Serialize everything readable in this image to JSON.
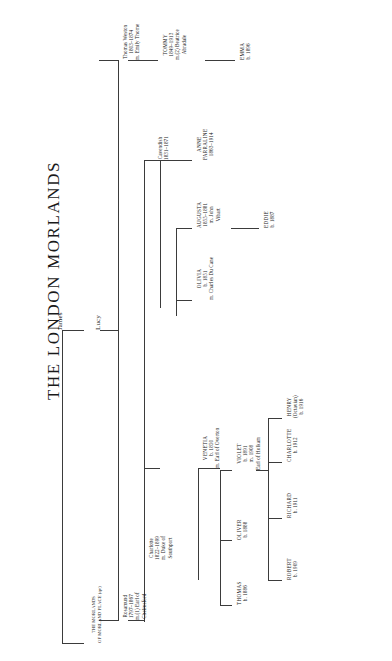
{
  "document": {
    "title": "THE LONDON MORLANDS",
    "line_color": "#3b3b3b",
    "background": "#ffffff",
    "orientation": "rotated-90"
  },
  "tree": {
    "root": {
      "id": "james",
      "label": "James"
    },
    "generation_2": {
      "id": "lucy",
      "label": "Lucy"
    },
    "cross_reference": {
      "id": "morland-place-ref",
      "line1": "THE MORLANDS",
      "line2": "OF MORLAND PLACE (qv)"
    },
    "nodes": [
      {
        "id": "thomas-weston",
        "lines": [
          "Thomas Weston",
          "1803–1874",
          "m. Emily Thorne"
        ]
      },
      {
        "id": "tommy",
        "lines": [
          "TOMMY",
          "1849–1913",
          "m.(2) Beatrice",
          "Abradale"
        ]
      },
      {
        "id": "emma",
        "lines": [
          "EMMA",
          "b. 1896"
        ]
      },
      {
        "id": "cavendish",
        "lines": [
          "Cavendish",
          "1831–1871"
        ]
      },
      {
        "id": "anne-farraline",
        "lines": [
          "ANNE",
          "FARRALINE",
          "1863–1914"
        ]
      },
      {
        "id": "rosamund",
        "lines": [
          "Rosamund",
          "1797–1867",
          "m.(1) Earl of",
          "Chelmsford"
        ]
      },
      {
        "id": "charlotte-duchess",
        "lines": [
          "Charlotte",
          "1822–1899",
          "m. Duke of",
          "Southport"
        ]
      },
      {
        "id": "augusta",
        "lines": [
          "AUGUSTA",
          "1855–1881",
          "m. John",
          "Vibart"
        ]
      },
      {
        "id": "eddie",
        "lines": [
          "EDDIE",
          "b. 1887"
        ]
      },
      {
        "id": "olivia",
        "lines": [
          "OLIVIA",
          "b. 1851",
          "m. Charles Du Cane"
        ]
      },
      {
        "id": "venetia",
        "lines": [
          "VENETIA",
          "b. 1850",
          "m. Earl of Overton"
        ]
      },
      {
        "id": "thomas",
        "lines": [
          "THOMAS",
          "b. 1886"
        ]
      },
      {
        "id": "oliver",
        "lines": [
          "OLIVER",
          "b. 1888"
        ]
      },
      {
        "id": "violet",
        "lines": [
          "VIOLET",
          "b. 1891",
          "m. 1908",
          "Earl of Holkam"
        ]
      },
      {
        "id": "robert",
        "lines": [
          "ROBERT",
          "b. 1909"
        ]
      },
      {
        "id": "richard",
        "lines": [
          "RICHARD",
          "b. 1911"
        ]
      },
      {
        "id": "charlotte",
        "lines": [
          "CHARLOTTE",
          "b. 1912"
        ]
      },
      {
        "id": "henry",
        "lines": [
          "HENRY",
          "(Octavian)",
          "b. 1916"
        ]
      }
    ]
  }
}
